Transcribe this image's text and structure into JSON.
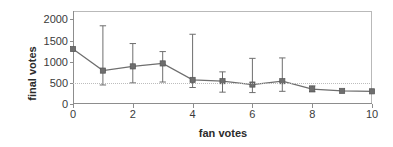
{
  "chart_data": {
    "type": "line",
    "title": "",
    "xlabel": "fan votes",
    "ylabel": "final votes",
    "xlim": [
      0,
      10
    ],
    "ylim": [
      0,
      2200
    ],
    "grid": "horizontal dotted gridline at y=500 only",
    "legend": "none",
    "xticks": [
      0,
      2,
      4,
      6,
      8,
      10
    ],
    "xtick_labels": [
      "0",
      "2",
      "4",
      "6",
      "8",
      "10"
    ],
    "yticks": [
      0,
      500,
      1000,
      1500,
      2000
    ],
    "ytick_labels": [
      "0",
      "500",
      "1000",
      "1500",
      "2000"
    ],
    "marker": "square",
    "series": [
      {
        "name": "final votes",
        "color": "#6e6e6e",
        "x": [
          0,
          1,
          2,
          3,
          4,
          5,
          6,
          7,
          8,
          9,
          10
        ],
        "values": [
          1300,
          790,
          890,
          960,
          570,
          540,
          460,
          540,
          350,
          310,
          300
        ],
        "error_high": [
          1300,
          1850,
          1430,
          1240,
          1650,
          760,
          1080,
          1090,
          430,
          310,
          300
        ],
        "error_low": [
          1300,
          450,
          500,
          520,
          390,
          280,
          270,
          300,
          290,
          310,
          300
        ]
      }
    ]
  }
}
